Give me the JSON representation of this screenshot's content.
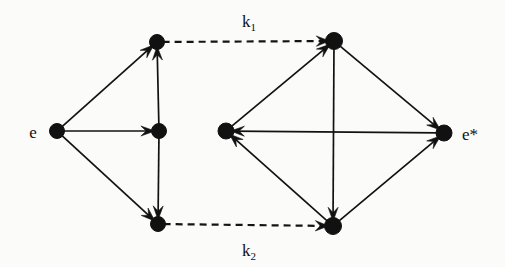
{
  "figure": {
    "title": "",
    "background_color": "#fbfbf9",
    "ink_color": "#111111",
    "width": 505,
    "height": 267
  },
  "labels": {
    "source": "e",
    "target": "e*",
    "rate_top_base": "k",
    "rate_top_sub": "1",
    "rate_bottom_base": "k",
    "rate_bottom_sub": "2",
    "rate_top_full": "k1",
    "rate_bottom_full": "k2"
  },
  "chart_data": {
    "type": "diagram",
    "diagram_kind": "directed-graph",
    "nodes": [
      {
        "id": "e",
        "label": "e",
        "label_side": "left",
        "x": 57,
        "y": 131,
        "r": 7.5,
        "cluster": "left"
      },
      {
        "id": "L1",
        "label": "",
        "label_side": "none",
        "x": 157,
        "y": 42,
        "r": 7.5,
        "cluster": "left"
      },
      {
        "id": "L2",
        "label": "",
        "label_side": "none",
        "x": 159,
        "y": 131,
        "r": 7.5,
        "cluster": "left"
      },
      {
        "id": "L3",
        "label": "",
        "label_side": "none",
        "x": 158,
        "y": 224,
        "r": 7.5,
        "cluster": "left"
      },
      {
        "id": "R1",
        "label": "",
        "label_side": "none",
        "x": 334,
        "y": 41,
        "r": 8.5,
        "cluster": "right"
      },
      {
        "id": "R2",
        "label": "",
        "label_side": "none",
        "x": 226,
        "y": 131,
        "r": 8.0,
        "cluster": "right"
      },
      {
        "id": "R3",
        "label": "",
        "label_side": "none",
        "x": 333,
        "y": 226,
        "r": 8.5,
        "cluster": "right"
      },
      {
        "id": "e*",
        "label": "e*",
        "label_side": "right",
        "x": 444,
        "y": 133,
        "r": 8.0,
        "cluster": "right"
      }
    ],
    "edges": [
      {
        "from": "e",
        "to": "L1",
        "style": "solid",
        "arrow": "end",
        "label": ""
      },
      {
        "from": "e",
        "to": "L2",
        "style": "solid",
        "arrow": "end",
        "label": ""
      },
      {
        "from": "e",
        "to": "L3",
        "style": "solid",
        "arrow": "end",
        "label": ""
      },
      {
        "from": "L2",
        "to": "L1",
        "style": "solid",
        "arrow": "end",
        "label": ""
      },
      {
        "from": "L2",
        "to": "L3",
        "style": "solid",
        "arrow": "end",
        "label": ""
      },
      {
        "from": "L1",
        "to": "R1",
        "style": "dashed",
        "arrow": "end",
        "label": "k1",
        "label_pos": "above"
      },
      {
        "from": "L3",
        "to": "R3",
        "style": "dashed",
        "arrow": "end",
        "label": "k2",
        "label_pos": "below"
      },
      {
        "from": "R2",
        "to": "R1",
        "style": "solid",
        "arrow": "end",
        "label": ""
      },
      {
        "from": "R1",
        "to": "e*",
        "style": "solid",
        "arrow": "end",
        "label": ""
      },
      {
        "from": "R1",
        "to": "R3",
        "style": "solid",
        "arrow": "end",
        "label": ""
      },
      {
        "from": "e*",
        "to": "R2",
        "style": "solid",
        "arrow": "end",
        "label": ""
      },
      {
        "from": "R3",
        "to": "R2",
        "style": "solid",
        "arrow": "end",
        "label": ""
      },
      {
        "from": "R3",
        "to": "e*",
        "style": "solid",
        "arrow": "end",
        "label": ""
      }
    ],
    "label_positions": {
      "k1": {
        "x": 249,
        "y": 27
      },
      "k2": {
        "x": 249,
        "y": 256
      },
      "e": {
        "x": 33,
        "y": 138
      },
      "e*": {
        "x": 462,
        "y": 140
      }
    }
  }
}
